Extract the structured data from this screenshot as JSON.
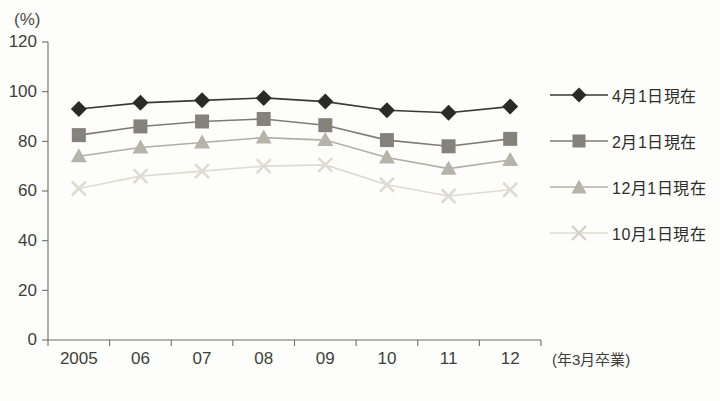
{
  "chart_data": {
    "type": "line",
    "title": "",
    "subtitle": "",
    "xlabel": "(年3月卒業)",
    "ylabel": "(%)",
    "categories": [
      "2005",
      "06",
      "07",
      "08",
      "09",
      "10",
      "11",
      "12"
    ],
    "ylim": [
      0,
      120
    ],
    "ytick_labels": [
      "0",
      "20",
      "40",
      "60",
      "80",
      "100",
      "120"
    ],
    "ytick_values": [
      0,
      20,
      40,
      60,
      80,
      100,
      120
    ],
    "grid": false,
    "legend_position": "right",
    "series": [
      {
        "name": "4月1日現在",
        "marker": "diamond",
        "color": "#2b2b26",
        "line_color": "#3a3a33",
        "values": [
          93.0,
          95.5,
          96.5,
          97.5,
          96.0,
          92.5,
          91.5,
          94.0
        ]
      },
      {
        "name": "2月1日現在",
        "marker": "square",
        "color": "#83837b",
        "line_color": "#7d7d75",
        "values": [
          82.5,
          86.0,
          88.0,
          89.0,
          86.5,
          80.5,
          78.0,
          81.0
        ]
      },
      {
        "name": "12月1日現在",
        "marker": "triangle",
        "color": "#b4b4aa",
        "line_color": "#b0b0a6",
        "values": [
          74.0,
          77.5,
          79.5,
          81.5,
          80.5,
          73.5,
          69.0,
          72.5
        ]
      },
      {
        "name": "10月1日現在",
        "marker": "cross",
        "color": "#dcdcd2",
        "line_color": "#dcdcd2",
        "values": [
          61.0,
          66.0,
          68.0,
          70.0,
          70.5,
          62.5,
          58.0,
          60.5
        ]
      }
    ]
  },
  "axis": {
    "y_unit": "(%)",
    "x_note": "(年3月卒業)"
  },
  "legend": {
    "items": [
      {
        "label": "4月1日現在",
        "marker": "diamond-marker-icon"
      },
      {
        "label": "2月1日現在",
        "marker": "square-marker-icon"
      },
      {
        "label": "12月1日現在",
        "marker": "triangle-marker-icon"
      },
      {
        "label": "10月1日現在",
        "marker": "cross-marker-icon"
      }
    ]
  },
  "colors": {
    "background": "#fdfdfb",
    "axis": "#6e6e66",
    "text": "#3f3f3a",
    "series1": "#2b2b26",
    "series2": "#83837b",
    "series3": "#b4b4aa",
    "series4": "#dcdcd2"
  }
}
